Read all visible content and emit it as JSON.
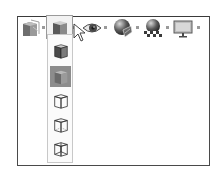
{
  "toolbar": {
    "buttons": [
      {
        "name": "display-style",
        "icon": "section-cube-icon"
      },
      {
        "name": "display-mode",
        "icon": "shaded-cube-icon",
        "open": true
      },
      {
        "name": "hide-show",
        "icon": "eye-icon"
      },
      {
        "name": "edit-appearance",
        "icon": "appearance-sphere-icon"
      },
      {
        "name": "apply-scene",
        "icon": "scene-sphere-icon"
      },
      {
        "name": "view-settings",
        "icon": "monitor-icon"
      }
    ]
  },
  "dropdown": {
    "items": [
      {
        "name": "shaded-with-edges",
        "icon": "shaded-edges-cube-icon"
      },
      {
        "name": "shaded",
        "icon": "shaded-cube-icon",
        "active": true
      },
      {
        "name": "hidden-lines-removed",
        "icon": "hidden-lines-removed-cube-icon"
      },
      {
        "name": "hidden-lines-visible",
        "icon": "hidden-lines-visible-cube-icon"
      },
      {
        "name": "wireframe",
        "icon": "wireframe-cube-icon"
      }
    ]
  },
  "colors": {
    "frame": "#4a4a4a",
    "active_item_bg": "#8c8c8c",
    "dropdown_border": "#c8c8c8",
    "cube_dark": "#3e3e3e",
    "cube_mid": "#7a7a7a",
    "cube_light": "#cfcfcf"
  }
}
